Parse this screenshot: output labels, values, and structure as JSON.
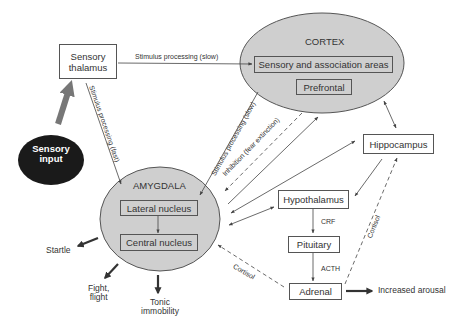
{
  "diagram": {
    "type": "fear-circuit flow diagram",
    "colors": {
      "region_fill": "#cfcfcf",
      "region_stroke": "#555555",
      "input_fill": "#1a1a1a",
      "input_text": "#ffffff",
      "big_arrow": "#777777",
      "line": "#444444",
      "text": "#333333"
    },
    "nodes": {
      "sensory_input": "Sensory input",
      "sensory_thalamus_line1": "Sensory",
      "sensory_thalamus_line2": "thalamus",
      "cortex": "CORTEX",
      "sensory_association": "Sensory and association areas",
      "prefrontal": "Prefrontal",
      "hippocampus": "Hippocampus",
      "amygdala": "AMYGDALA",
      "lateral_nucleus": "Lateral nucleus",
      "central_nucleus": "Central nucleus",
      "hypothalamus": "Hypothalamus",
      "pituitary": "Pituitary",
      "adrenal": "Adrenal"
    },
    "edge_labels": {
      "thalamus_to_cortex": "Stimulus processing (slow)",
      "thalamus_to_amygdala": "Stimulus processing (fast)",
      "cortex_to_amygdala": "Stimulus processing (slow)",
      "prefrontal_inhibition": "Inhibition (fear extinction)",
      "crf": "CRF",
      "acth": "ACTH",
      "cortisol_to_amygdala": "Cortisol",
      "cortisol_to_hippocampus": "Cortisol"
    },
    "outputs": {
      "startle": "Startle",
      "fight_flight_line1": "Fight,",
      "fight_flight_line2": "flight",
      "tonic_line1": "Tonic",
      "tonic_line2": "immobility",
      "increased_arousal": "Increased arousal"
    },
    "edges": [
      {
        "from": "Sensory input",
        "to": "Sensory thalamus",
        "style": "thick"
      },
      {
        "from": "Sensory thalamus",
        "to": "Sensory and association areas",
        "style": "solid",
        "label": "Stimulus processing (slow)"
      },
      {
        "from": "Sensory thalamus",
        "to": "Amygdala",
        "style": "solid",
        "label": "Stimulus processing (fast)"
      },
      {
        "from": "Cortex",
        "to": "Amygdala",
        "style": "solid",
        "label": "Stimulus processing (slow)"
      },
      {
        "from": "Prefrontal",
        "to": "Amygdala",
        "style": "dashed",
        "label": "Inhibition (fear extinction)"
      },
      {
        "from": "Amygdala",
        "to": "Cortex",
        "style": "solid"
      },
      {
        "from": "Amygdala",
        "to": "Hippocampus",
        "style": "bidirectional"
      },
      {
        "from": "Amygdala",
        "to": "Hypothalamus",
        "style": "bidirectional"
      },
      {
        "from": "Cortex",
        "to": "Hippocampus",
        "style": "bidirectional"
      },
      {
        "from": "Hippocampus",
        "to": "Hypothalamus",
        "style": "solid"
      },
      {
        "from": "Lateral nucleus",
        "to": "Central nucleus",
        "style": "solid"
      },
      {
        "from": "Hypothalamus",
        "to": "Pituitary",
        "style": "solid",
        "label": "CRF"
      },
      {
        "from": "Pituitary",
        "to": "Adrenal",
        "style": "solid",
        "label": "ACTH"
      },
      {
        "from": "Adrenal",
        "to": "Amygdala",
        "style": "dashed",
        "label": "Cortisol"
      },
      {
        "from": "Adrenal",
        "to": "Hippocampus",
        "style": "dashed",
        "label": "Cortisol"
      },
      {
        "from": "Adrenal",
        "to": "Increased arousal",
        "style": "thick"
      },
      {
        "from": "Amygdala",
        "to": "Startle",
        "style": "thick"
      },
      {
        "from": "Amygdala",
        "to": "Fight, flight",
        "style": "thick"
      },
      {
        "from": "Amygdala",
        "to": "Tonic immobility",
        "style": "thick"
      }
    ]
  }
}
